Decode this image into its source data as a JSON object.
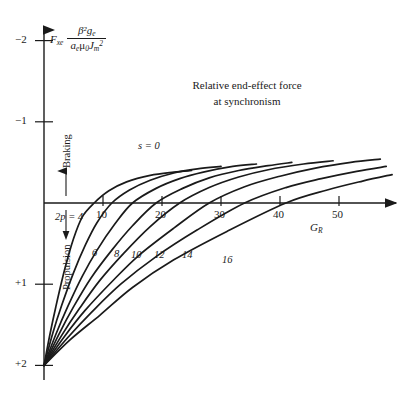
{
  "figure": {
    "title_line1": "Relative end-effect force",
    "title_line2": "at synchronism",
    "slip_annotation": "s = 0",
    "y_axis_label_parts": {
      "symbol": "F",
      "symbol_sub": "xe",
      "numerator": "β²g",
      "numerator_sub": "e",
      "denominator_a": "a",
      "denominator_a_sub": "e",
      "denominator_mu": "μ",
      "denominator_mu_sub": "0",
      "denominator_j": "J",
      "denominator_j_sub": "m",
      "denominator_j_sup": "2"
    },
    "x_axis_label": "G",
    "x_axis_label_sub": "R",
    "direction_up_label": "Braking",
    "direction_down_label": "Propulsion",
    "first_curve_prefix": "2p = 4"
  },
  "chart_data": {
    "type": "line",
    "title": "Relative end-effect force at synchronism",
    "xlabel": "G_R",
    "ylabel": "F_xe β²g_e / (a_e μ_0 J_m²)",
    "xlim": [
      0,
      59
    ],
    "ylim": [
      -2,
      2
    ],
    "y_axis_inverted": true,
    "grid": false,
    "legend": "inline curve labels",
    "annotations": [
      "s = 0",
      "Braking",
      "Propulsion"
    ],
    "x_ticks": [
      10,
      20,
      30,
      40,
      50
    ],
    "x_tick_labels": [
      "10",
      "20",
      "30",
      "40",
      "50"
    ],
    "y_ticks": [
      -2,
      -1,
      0,
      1,
      2
    ],
    "y_tick_labels": [
      "−2",
      "−1",
      "",
      "+1",
      "+2"
    ],
    "series_parameter": "2p",
    "series": [
      {
        "name": "4",
        "label": "2p = 4",
        "zero_crossing": 8.5,
        "x": [
          0,
          1,
          2,
          3.5,
          5,
          6.5,
          8.5,
          11,
          14,
          18,
          22,
          25
        ],
        "y": [
          2.0,
          1.62,
          1.28,
          0.82,
          0.44,
          0.17,
          0.0,
          -0.15,
          -0.26,
          -0.34,
          -0.38,
          -0.4
        ]
      },
      {
        "name": "6",
        "label": "6",
        "zero_crossing": 11.5,
        "x": [
          0,
          1.5,
          3,
          5,
          7,
          9,
          11.5,
          14.5,
          18,
          22,
          26,
          30
        ],
        "y": [
          2.0,
          1.6,
          1.26,
          0.86,
          0.52,
          0.24,
          0.0,
          -0.16,
          -0.28,
          -0.37,
          -0.42,
          -0.45
        ]
      },
      {
        "name": "8",
        "label": "8",
        "zero_crossing": 15,
        "x": [
          0,
          2,
          4,
          6.5,
          9,
          12,
          15,
          19,
          23,
          27,
          32,
          36
        ],
        "y": [
          2.0,
          1.62,
          1.28,
          0.9,
          0.58,
          0.26,
          0.0,
          -0.18,
          -0.3,
          -0.38,
          -0.45,
          -0.48
        ]
      },
      {
        "name": "10",
        "label": "10",
        "zero_crossing": 19,
        "x": [
          0,
          2.5,
          5,
          8,
          11.5,
          15,
          19,
          23.5,
          28,
          33,
          38,
          42
        ],
        "y": [
          2.0,
          1.62,
          1.28,
          0.92,
          0.58,
          0.28,
          0.0,
          -0.18,
          -0.31,
          -0.4,
          -0.46,
          -0.5
        ]
      },
      {
        "name": "12",
        "label": "12",
        "zero_crossing": 23,
        "x": [
          0,
          3,
          6,
          9.5,
          13.5,
          18,
          23,
          28,
          33,
          38,
          44,
          49
        ],
        "y": [
          2.0,
          1.63,
          1.3,
          0.95,
          0.62,
          0.29,
          0.0,
          -0.19,
          -0.32,
          -0.41,
          -0.48,
          -0.52
        ]
      },
      {
        "name": "14",
        "label": "14",
        "zero_crossing": 28,
        "x": [
          0,
          3.5,
          7,
          11.5,
          16,
          22,
          28,
          34,
          40,
          46,
          52,
          57
        ],
        "y": [
          2.0,
          1.64,
          1.32,
          0.97,
          0.65,
          0.31,
          0.0,
          -0.2,
          -0.33,
          -0.43,
          -0.5,
          -0.54
        ]
      },
      {
        "name": "16",
        "label": "16",
        "zero_crossing": 34,
        "x": [
          0,
          4,
          8,
          13,
          19,
          26,
          34,
          41,
          47,
          53,
          58
        ],
        "y": [
          2.0,
          1.66,
          1.35,
          1.0,
          0.66,
          0.33,
          0.0,
          -0.19,
          -0.3,
          -0.39,
          -0.45
        ]
      },
      {
        "name": "18",
        "label": "",
        "zero_crossing": 41,
        "x": [
          0,
          4.5,
          9.5,
          15,
          22,
          31,
          41,
          48,
          54,
          59
        ],
        "y": [
          2.0,
          1.68,
          1.38,
          1.04,
          0.7,
          0.35,
          0.0,
          -0.16,
          -0.27,
          -0.35
        ]
      }
    ],
    "curve_labels": [
      {
        "text": "2p = 4",
        "x_px": 55,
        "y_px": 212
      },
      {
        "text": "6",
        "x_px": 92,
        "y_px": 248
      },
      {
        "text": "8",
        "x_px": 114,
        "y_px": 249
      },
      {
        "text": "10",
        "x_px": 131,
        "y_px": 250
      },
      {
        "text": "12",
        "x_px": 154,
        "y_px": 250
      },
      {
        "text": "14",
        "x_px": 182,
        "y_px": 250
      },
      {
        "text": "16",
        "x_px": 222,
        "y_px": 255
      }
    ]
  }
}
